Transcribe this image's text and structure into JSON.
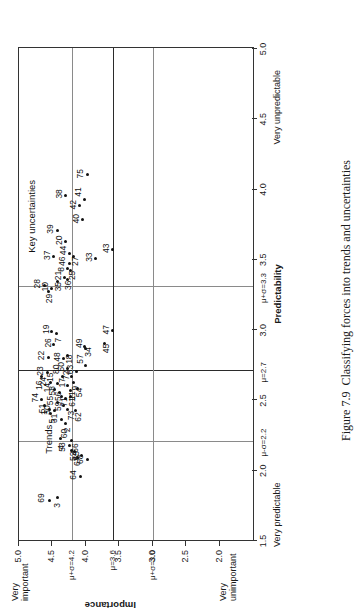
{
  "figure": {
    "caption_label": "Figure 7.9",
    "caption_text": "Classifying forces into trends and uncertainties",
    "rotation_note": "90"
  },
  "axes": {
    "x_title": "Predictability",
    "x_low_label": "Very predictable",
    "x_high_label": "Very unpredictable",
    "y_title": "Importance",
    "y_high_label_line1": "Very",
    "y_high_label_line2": "important",
    "y_low_label_line1": "Very",
    "y_low_label_line2": "unimportant",
    "x_ticks": [
      "1.5",
      "2.0",
      "2.5",
      "3.0",
      "3.5",
      "4.0",
      "4.5",
      "5.0"
    ],
    "x_tick_values": [
      1.5,
      2.0,
      2.5,
      3.0,
      3.5,
      4.0,
      4.5,
      5.0
    ],
    "x_ref_labels": [
      "μ-σ=2.2",
      "μ=2.7",
      "μ+σ=3.3"
    ],
    "x_ref_values": [
      2.2,
      2.7,
      3.3
    ],
    "y_ticks": [
      "2.0",
      "2.5",
      "3.0",
      "3.5",
      "4.0",
      "4.5",
      "5.0"
    ],
    "y_tick_values": [
      2.0,
      2.5,
      3.0,
      3.5,
      4.0,
      4.5,
      5.0
    ],
    "y_ref_labels": [
      "μ+σ=3.0",
      "μ=3.6",
      "μ+σ=4.2"
    ],
    "y_ref_values": [
      3.0,
      3.6,
      4.2
    ],
    "xlim": [
      1.5,
      5.0
    ],
    "ylim": [
      1.5,
      5.0
    ]
  },
  "quadrant_labels": [
    {
      "text": "Trends",
      "x": 2.12,
      "y": 4.62
    },
    {
      "text": "Key uncertainties",
      "x": 3.55,
      "y": 4.88
    }
  ],
  "chart_data": {
    "type": "scatter",
    "title": "Classifying forces into trends and uncertainties",
    "xlabel": "Predictability",
    "ylabel": "Importance",
    "xlim": [
      1.5,
      5.0
    ],
    "ylim": [
      1.5,
      5.0
    ],
    "grid": false,
    "legend": "none",
    "point_label_field": "id",
    "reference_lines": {
      "vertical": [
        {
          "value": 2.2,
          "label": "μ-σ=2.2",
          "style": "thin-grey"
        },
        {
          "value": 2.7,
          "label": "μ=2.7",
          "style": "thick-dark"
        },
        {
          "value": 3.3,
          "label": "μ+σ=3.3",
          "style": "thin-grey"
        }
      ],
      "horizontal": [
        {
          "value": 3.0,
          "label": "μ+σ=3.0",
          "style": "thin-grey"
        },
        {
          "value": 3.6,
          "label": "μ=3.6",
          "style": "thick-dark"
        },
        {
          "value": 4.2,
          "label": "μ+σ=4.2",
          "style": "thin-grey"
        }
      ]
    },
    "points": [
      {
        "id": "69",
        "x": 1.78,
        "y": 4.55,
        "lx": -2,
        "ly": -12
      },
      {
        "id": "3",
        "x": 1.8,
        "y": 4.42,
        "lx": -10,
        "ly": -5
      },
      {
        "id": "64",
        "x": 1.95,
        "y": 4.08,
        "lx": -3,
        "ly": -12
      },
      {
        "id": "68",
        "x": 2.07,
        "y": 3.97,
        "lx": -4,
        "ly": -12
      },
      {
        "id": "66",
        "x": 2.1,
        "y": 4.06,
        "lx": 3,
        "ly": -11
      },
      {
        "id": "67",
        "x": 2.09,
        "y": 4.13,
        "lx": -9,
        "ly": -4
      },
      {
        "id": "65",
        "x": 2.13,
        "y": 4.17,
        "lx": -9,
        "ly": -2
      },
      {
        "id": "52",
        "x": 2.14,
        "y": 4.22,
        "lx": -11,
        "ly": -2
      },
      {
        "id": "53",
        "x": 2.17,
        "y": 4.25,
        "lx": -6,
        "ly": -11
      },
      {
        "id": "60",
        "x": 2.21,
        "y": 4.22,
        "lx": 2,
        "ly": -11
      },
      {
        "id": "4",
        "x": 2.22,
        "y": 4.38,
        "lx": -11,
        "ly": -3
      },
      {
        "id": "2",
        "x": 2.33,
        "y": 4.3,
        "lx": -9,
        "ly": -3
      },
      {
        "id": "31",
        "x": 2.36,
        "y": 4.37,
        "lx": -4,
        "ly": -11
      },
      {
        "id": "30",
        "x": 2.42,
        "y": 4.47,
        "lx": -4,
        "ly": -11
      },
      {
        "id": "51",
        "x": 2.43,
        "y": 4.55,
        "lx": -4,
        "ly": -11
      },
      {
        "id": "1",
        "x": 2.46,
        "y": 4.62,
        "lx": -10,
        "ly": -4
      },
      {
        "id": "74",
        "x": 2.5,
        "y": 4.66,
        "lx": -3,
        "ly": -11
      },
      {
        "id": "73",
        "x": 2.43,
        "y": 4.27,
        "lx": -11,
        "ly": -1
      },
      {
        "id": "59",
        "x": 2.46,
        "y": 4.33,
        "lx": -6,
        "ly": -10
      },
      {
        "id": "55",
        "x": 2.48,
        "y": 4.43,
        "lx": -3,
        "ly": -11
      },
      {
        "id": "56",
        "x": 2.51,
        "y": 4.31,
        "lx": -3,
        "ly": -11
      },
      {
        "id": "58",
        "x": 2.55,
        "y": 4.4,
        "lx": -3,
        "ly": -11
      },
      {
        "id": "14",
        "x": 2.57,
        "y": 4.47,
        "lx": -3,
        "ly": -11
      },
      {
        "id": "15",
        "x": 2.61,
        "y": 4.43,
        "lx": 2,
        "ly": -11
      },
      {
        "id": "24",
        "x": 2.62,
        "y": 4.53,
        "lx": -4,
        "ly": -11
      },
      {
        "id": "23",
        "x": 2.69,
        "y": 4.58,
        "lx": -3,
        "ly": -11
      },
      {
        "id": "22",
        "x": 2.8,
        "y": 4.56,
        "lx": -3,
        "ly": -11
      },
      {
        "id": "16",
        "x": 2.66,
        "y": 4.67,
        "lx": -13,
        "ly": -6
      },
      {
        "id": "80",
        "x": 2.66,
        "y": 4.35,
        "lx": 3,
        "ly": -10
      },
      {
        "id": "61",
        "x": 2.52,
        "y": 4.23,
        "lx": -10,
        "ly": -2
      },
      {
        "id": "62",
        "x": 2.42,
        "y": 4.15,
        "lx": -11,
        "ly": -2
      },
      {
        "id": "11",
        "x": 2.56,
        "y": 4.23,
        "lx": -9,
        "ly": -2
      },
      {
        "id": "17",
        "x": 2.6,
        "y": 4.27,
        "lx": -2,
        "ly": -10
      },
      {
        "id": "54",
        "x": 2.58,
        "y": 4.13,
        "lx": -9,
        "ly": -2
      },
      {
        "id": "9",
        "x": 2.62,
        "y": 4.19,
        "lx": -8,
        "ly": -2
      },
      {
        "id": "72",
        "x": 2.66,
        "y": 4.21,
        "lx": -3,
        "ly": -10
      },
      {
        "id": "63",
        "x": 2.7,
        "y": 4.14,
        "lx": -3,
        "ly": -10
      },
      {
        "id": "50",
        "x": 2.72,
        "y": 4.28,
        "lx": -3,
        "ly": -10
      },
      {
        "id": "48",
        "x": 2.79,
        "y": 4.34,
        "lx": -3,
        "ly": -10
      },
      {
        "id": "18",
        "x": 2.81,
        "y": 4.28,
        "lx": -8,
        "ly": -2
      },
      {
        "id": "26",
        "x": 2.89,
        "y": 4.48,
        "lx": -3,
        "ly": -10
      },
      {
        "id": "7",
        "x": 2.97,
        "y": 4.44,
        "lx": -9,
        "ly": -2
      },
      {
        "id": "19",
        "x": 2.98,
        "y": 4.51,
        "lx": -2,
        "ly": -10
      },
      {
        "id": "57",
        "x": 2.74,
        "y": 4.0,
        "lx": 2,
        "ly": -10
      },
      {
        "id": "34",
        "x": 2.86,
        "y": 4.0,
        "lx": -8,
        "ly": -2
      },
      {
        "id": "49",
        "x": 2.88,
        "y": 4.02,
        "lx": -2,
        "ly": -10
      },
      {
        "id": "45",
        "x": 2.9,
        "y": 3.72,
        "lx": -10,
        "ly": -3
      },
      {
        "id": "47",
        "x": 2.99,
        "y": 3.6,
        "lx": -4,
        "ly": -11
      },
      {
        "id": "29",
        "x": 3.27,
        "y": 4.56,
        "lx": -12,
        "ly": -3
      },
      {
        "id": "10",
        "x": 3.29,
        "y": 4.52,
        "lx": -3,
        "ly": -10
      },
      {
        "id": "28",
        "x": 3.31,
        "y": 4.62,
        "lx": -3,
        "ly": -11
      },
      {
        "id": "35",
        "x": 3.34,
        "y": 4.43,
        "lx": -10,
        "ly": -3
      },
      {
        "id": "36",
        "x": 3.35,
        "y": 4.28,
        "lx": -10,
        "ly": -3
      },
      {
        "id": "21",
        "x": 3.37,
        "y": 4.32,
        "lx": -3,
        "ly": -10
      },
      {
        "id": "25",
        "x": 3.42,
        "y": 4.23,
        "lx": -10,
        "ly": -2
      },
      {
        "id": "8",
        "x": 3.43,
        "y": 4.28,
        "lx": -3,
        "ly": -10
      },
      {
        "id": "46",
        "x": 3.47,
        "y": 4.25,
        "lx": -3,
        "ly": -11
      },
      {
        "id": "27",
        "x": 3.52,
        "y": 4.18,
        "lx": -10,
        "ly": -3
      },
      {
        "id": "44",
        "x": 3.54,
        "y": 4.25,
        "lx": -2,
        "ly": -10
      },
      {
        "id": "37",
        "x": 3.52,
        "y": 4.48,
        "lx": -4,
        "ly": -11
      },
      {
        "id": "39",
        "x": 3.7,
        "y": 4.43,
        "lx": -3,
        "ly": -11
      },
      {
        "id": "20",
        "x": 3.62,
        "y": 4.3,
        "lx": -3,
        "ly": -11
      },
      {
        "id": "33",
        "x": 3.5,
        "y": 3.85,
        "lx": -3,
        "ly": -11
      },
      {
        "id": "43",
        "x": 3.57,
        "y": 3.6,
        "lx": -4,
        "ly": -11
      },
      {
        "id": "40",
        "x": 3.78,
        "y": 4.05,
        "lx": -4,
        "ly": -11
      },
      {
        "id": "42",
        "x": 3.88,
        "y": 4.09,
        "lx": -4,
        "ly": -11
      },
      {
        "id": "41",
        "x": 3.92,
        "y": 4.02,
        "lx": 3,
        "ly": -11
      },
      {
        "id": "38",
        "x": 3.95,
        "y": 4.3,
        "lx": -3,
        "ly": -11
      },
      {
        "id": "75",
        "x": 4.1,
        "y": 3.97,
        "lx": -4,
        "ly": -12
      },
      {
        "id": "5",
        "x": 2.4,
        "y": 4.53,
        "lx": -10,
        "ly": -2
      },
      {
        "id": "71",
        "x": 2.52,
        "y": 4.36,
        "lx": -10,
        "ly": -2
      }
    ]
  }
}
